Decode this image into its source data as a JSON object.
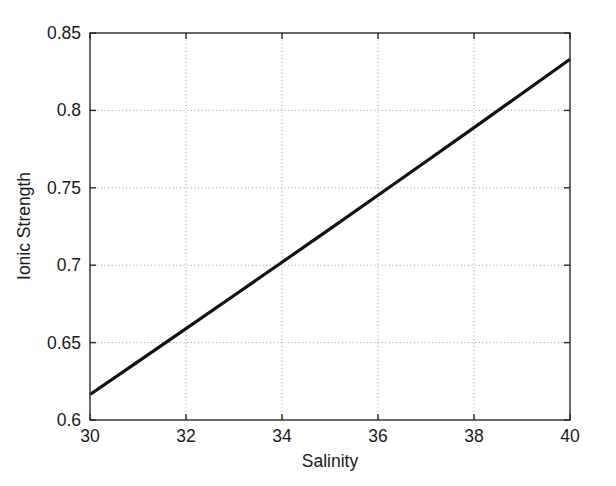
{
  "figure": {
    "background": "#ffffff",
    "width": 616,
    "height": 486
  },
  "chart_data": {
    "type": "line",
    "title": "",
    "xlabel": "Salinity",
    "ylabel": "Ionic Strength",
    "xlim": [
      30,
      40
    ],
    "ylim": [
      0.6,
      0.85
    ],
    "xticks": [
      30,
      32,
      34,
      36,
      38,
      40
    ],
    "yticks": [
      0.6,
      0.65,
      0.7,
      0.75,
      0.8,
      0.85
    ],
    "xtick_labels": [
      "30",
      "32",
      "34",
      "36",
      "38",
      "40"
    ],
    "ytick_labels": [
      "0.6",
      "0.65",
      "0.7",
      "0.75",
      "0.8",
      "0.85"
    ],
    "grid": true,
    "grid_style": "dotted",
    "grid_color": "#9a9a9a",
    "legend": null,
    "series": [
      {
        "name": "Ionic Strength",
        "color": "#111111",
        "linewidth": 3.2,
        "x": [
          30,
          31,
          32,
          33,
          34,
          35,
          36,
          37,
          38,
          39,
          40
        ],
        "values": [
          0.6165,
          0.6377,
          0.659,
          0.6804,
          0.7019,
          0.7235,
          0.7452,
          0.767,
          0.7889,
          0.8109,
          0.833
        ]
      }
    ]
  },
  "axes": {
    "plot_left_px": 90,
    "plot_right_px": 570,
    "plot_top_px": 33,
    "plot_bottom_px": 420
  }
}
